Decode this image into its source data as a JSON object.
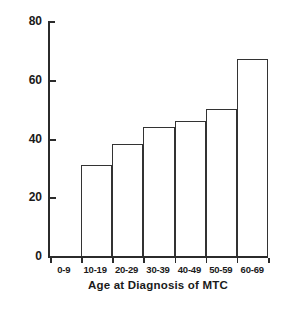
{
  "chart_data": {
    "type": "bar",
    "title": "",
    "xlabel": "Age at Diagnosis of MTC",
    "ylabel": "Incidence of Recurrence, %",
    "categories": [
      "0-9",
      "10-19",
      "20-29",
      "30-39",
      "40-49",
      "50-59",
      "60-69"
    ],
    "values": [
      0,
      31,
      38,
      44,
      46,
      50,
      67
    ],
    "ylim": [
      0,
      80
    ],
    "yticks": [
      0,
      20,
      40,
      60,
      80
    ],
    "ytick_labels": [
      "0",
      "20",
      "40",
      "60",
      "80"
    ],
    "grid": false,
    "legend": "none",
    "bar_fill_color": "#ffffff",
    "bar_edge_color": "#333333",
    "axis_color": "#2b2b2b"
  }
}
